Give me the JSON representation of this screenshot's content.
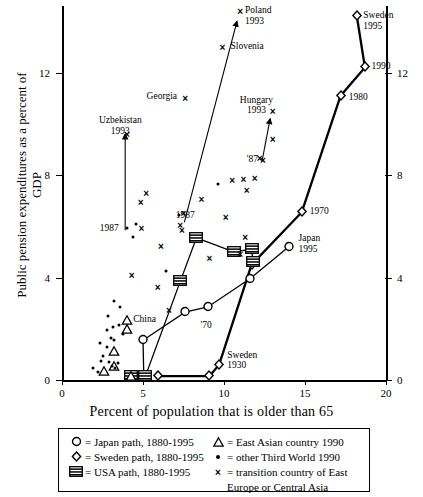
{
  "chart_data": {
    "type": "scatter",
    "title": "",
    "xlabel": "Percent of population that is older than 65",
    "ylabel": "Public pension expenditures as a percent of GDP",
    "xlim": [
      0,
      20
    ],
    "ylim": [
      0,
      14.6
    ],
    "xticks": [
      0,
      5,
      10,
      15,
      20
    ],
    "yticks": [
      0,
      4,
      8,
      12
    ],
    "right_axis_ticks": [
      0,
      4,
      8,
      12
    ],
    "grid": false,
    "legend_position": "below-axis",
    "series": [
      {
        "name": "Japan path, 1880-1995",
        "symbol": "circle",
        "points": [
          {
            "x": 5.05,
            "y": 0.15
          },
          {
            "x": 5.0,
            "y": 1.55
          },
          {
            "x": 7.6,
            "y": 2.65
          },
          {
            "x": 9.0,
            "y": 2.85
          },
          {
            "x": 11.6,
            "y": 3.95
          },
          {
            "x": 14.0,
            "y": 5.2
          }
        ]
      },
      {
        "name": "Sweden path, 1880-1995",
        "symbol": "diamond",
        "points": [
          {
            "x": 5.9,
            "y": 0.15
          },
          {
            "x": 9.1,
            "y": 0.15
          },
          {
            "x": 9.7,
            "y": 0.6
          },
          {
            "x": 11.7,
            "y": 4.5
          },
          {
            "x": 14.8,
            "y": 6.55
          },
          {
            "x": 17.2,
            "y": 11.1
          },
          {
            "x": 18.7,
            "y": 12.2
          },
          {
            "x": 18.2,
            "y": 14.2
          }
        ]
      },
      {
        "name": "USA path, 1880-1995",
        "symbol": "usa-flag",
        "points": [
          {
            "x": 4.25,
            "y": 0.15
          },
          {
            "x": 5.15,
            "y": 0.15
          },
          {
            "x": 7.3,
            "y": 3.85
          },
          {
            "x": 8.3,
            "y": 5.55
          },
          {
            "x": 10.6,
            "y": 5.0
          },
          {
            "x": 11.7,
            "y": 5.1
          },
          {
            "x": 11.8,
            "y": 4.6
          }
        ]
      }
    ],
    "point_groups": [
      {
        "name": "East Asian country 1990",
        "symbol": "triangle",
        "points": [
          {
            "x": 3.2,
            "y": 1.15
          },
          {
            "x": 3.2,
            "y": 0.55
          },
          {
            "x": 4.0,
            "y": 2.35
          },
          {
            "x": 4.0,
            "y": 2.0
          },
          {
            "x": 4.25,
            "y": 0.15
          },
          {
            "x": 2.6,
            "y": 0.35
          }
        ]
      },
      {
        "name": "other Third World 1990",
        "symbol": "dot",
        "points": [
          {
            "x": 2.5,
            "y": 0.95
          },
          {
            "x": 2.4,
            "y": 0.75
          },
          {
            "x": 2.9,
            "y": 0.7
          },
          {
            "x": 3.1,
            "y": 0.55
          },
          {
            "x": 3.3,
            "y": 0.45
          },
          {
            "x": 3.45,
            "y": 0.65
          },
          {
            "x": 2.75,
            "y": 1.3
          },
          {
            "x": 2.35,
            "y": 1.45
          },
          {
            "x": 3.0,
            "y": 1.65
          },
          {
            "x": 3.2,
            "y": 1.55
          },
          {
            "x": 2.75,
            "y": 1.95
          },
          {
            "x": 3.15,
            "y": 2.05
          },
          {
            "x": 3.5,
            "y": 2.15
          },
          {
            "x": 3.75,
            "y": 1.8
          },
          {
            "x": 2.85,
            "y": 2.5
          },
          {
            "x": 3.55,
            "y": 2.85
          },
          {
            "x": 3.2,
            "y": 3.1
          },
          {
            "x": 4.0,
            "y": 5.95
          },
          {
            "x": 4.55,
            "y": 6.1
          },
          {
            "x": 4.4,
            "y": 5.6
          },
          {
            "x": 6.45,
            "y": 4.25
          },
          {
            "x": 7.2,
            "y": 6.45
          },
          {
            "x": 9.6,
            "y": 7.65
          },
          {
            "x": 2.2,
            "y": 0.3
          },
          {
            "x": 1.9,
            "y": 0.45
          }
        ]
      },
      {
        "name": "transition country of East Europe or Central Asia",
        "symbol": "cross",
        "points": [
          {
            "x": 11.0,
            "y": 14.4
          },
          {
            "x": 9.9,
            "y": 13.0
          },
          {
            "x": 7.6,
            "y": 11.0
          },
          {
            "x": 13.0,
            "y": 10.5
          },
          {
            "x": 13.0,
            "y": 9.4
          },
          {
            "x": 12.2,
            "y": 8.65
          },
          {
            "x": 12.4,
            "y": 8.6
          },
          {
            "x": 4.0,
            "y": 9.6
          },
          {
            "x": 5.2,
            "y": 7.3
          },
          {
            "x": 4.85,
            "y": 6.95
          },
          {
            "x": 10.5,
            "y": 7.8
          },
          {
            "x": 11.2,
            "y": 7.85
          },
          {
            "x": 11.9,
            "y": 7.9
          },
          {
            "x": 11.4,
            "y": 7.4
          },
          {
            "x": 8.6,
            "y": 7.05
          },
          {
            "x": 4.9,
            "y": 5.95
          },
          {
            "x": 7.5,
            "y": 6.5
          },
          {
            "x": 7.3,
            "y": 6.05
          },
          {
            "x": 7.4,
            "y": 5.85
          },
          {
            "x": 10.1,
            "y": 6.35
          },
          {
            "x": 6.1,
            "y": 5.25
          },
          {
            "x": 4.3,
            "y": 4.1
          },
          {
            "x": 9.1,
            "y": 4.75
          },
          {
            "x": 11.0,
            "y": 4.9
          },
          {
            "x": 5.9,
            "y": 3.65
          },
          {
            "x": 6.6,
            "y": 2.75
          },
          {
            "x": 11.3,
            "y": 5.6
          }
        ]
      }
    ],
    "annotations": [
      {
        "text_lines": [
          "Poland",
          "1993"
        ],
        "x": 11.3,
        "y": 14.4,
        "align": "left"
      },
      {
        "text_lines": [
          "Slovenia"
        ],
        "x": 10.4,
        "y": 13.0,
        "align": "left"
      },
      {
        "text_lines": [
          "Georgia"
        ],
        "x": 7.1,
        "y": 11.05,
        "align": "right"
      },
      {
        "text_lines": [
          "Hungary",
          "1993"
        ],
        "x": 12.0,
        "y": 10.9,
        "align": "center"
      },
      {
        "text_lines": [
          "'87"
        ],
        "x": 12.1,
        "y": 8.6,
        "align": "right"
      },
      {
        "text_lines": [
          "Uzbekistan",
          "1993"
        ],
        "x": 3.6,
        "y": 10.1,
        "align": "center"
      },
      {
        "text_lines": [
          "1987"
        ],
        "x": 3.5,
        "y": 5.9,
        "align": "right"
      },
      {
        "text_lines": [
          "1987"
        ],
        "x": 8.2,
        "y": 6.4,
        "align": "right"
      },
      {
        "text_lines": [
          "Sweden",
          "1995"
        ],
        "x": 18.6,
        "y": 14.2,
        "align": "left"
      },
      {
        "text_lines": [
          "1990"
        ],
        "x": 19.1,
        "y": 12.2,
        "align": "left"
      },
      {
        "text_lines": [
          "1980"
        ],
        "x": 17.7,
        "y": 11.0,
        "align": "left"
      },
      {
        "text_lines": [
          "1970"
        ],
        "x": 15.3,
        "y": 6.55,
        "align": "left"
      },
      {
        "text_lines": [
          "Japan",
          "1995"
        ],
        "x": 14.6,
        "y": 5.5,
        "align": "left"
      },
      {
        "text_lines": [
          "Sweden",
          "1930"
        ],
        "x": 10.2,
        "y": 0.95,
        "align": "left"
      },
      {
        "text_lines": [
          "China"
        ],
        "x": 4.4,
        "y": 2.35,
        "align": "left"
      },
      {
        "text_lines": [
          "'70"
        ],
        "x": 8.9,
        "y": 2.1,
        "align": "center"
      }
    ],
    "arrows": [
      {
        "from": {
          "x": 7.55,
          "y": 6.15
        },
        "to": {
          "x": 10.8,
          "y": 14.0
        },
        "note": "Poland 1987 to 1993"
      },
      {
        "from": {
          "x": 3.9,
          "y": 5.85
        },
        "to": {
          "x": 3.9,
          "y": 9.6
        },
        "note": "Uzbekistan 1987 to 1993"
      },
      {
        "from": {
          "x": 12.35,
          "y": 8.55
        },
        "to": {
          "x": 12.85,
          "y": 10.2
        },
        "note": "Hungary '87 to 1993"
      }
    ]
  },
  "axes": {
    "y_title": "Public pension expenditures as a percent of GDP",
    "x_title": "Percent of population that is older than 65",
    "x_tick_labels": [
      "0",
      "5",
      "10",
      "15",
      "20"
    ],
    "y_tick_labels": [
      "0",
      "4",
      "8",
      "12"
    ],
    "y_tick_labels_right": [
      "0",
      "4",
      "8",
      "12"
    ]
  },
  "legend": {
    "entries": [
      {
        "symbol": "circle",
        "symbol_char": "O",
        "text": "= Japan path, 1880-1995"
      },
      {
        "symbol": "diamond",
        "symbol_char": "◇",
        "text": "= Sweden path, 1880-1995"
      },
      {
        "symbol": "usa-flag",
        "symbol_char": "▤",
        "text": "= USA path, 1880-1995"
      },
      {
        "symbol": "triangle",
        "symbol_char": "△",
        "text": "= East Asian country 1990"
      },
      {
        "symbol": "dot",
        "symbol_char": "•",
        "text": "= other Third World 1990"
      },
      {
        "symbol": "cross",
        "symbol_char": "×",
        "text": "= transition country of East"
      },
      {
        "symbol": "none",
        "symbol_char": "",
        "text": "Europe or Central Asia"
      }
    ]
  },
  "colors": {
    "ink": "#000000",
    "background": "#ffffff"
  }
}
